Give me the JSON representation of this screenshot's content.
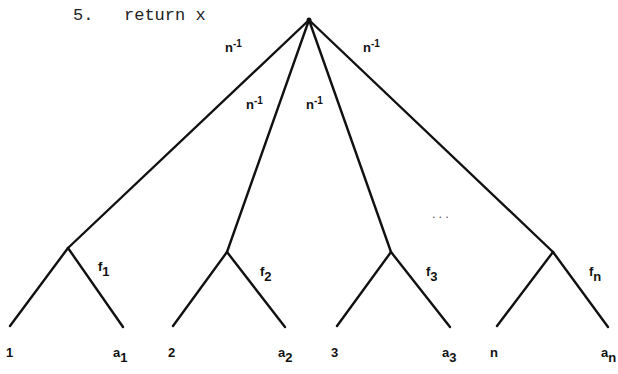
{
  "code_line": {
    "number": "5.",
    "text": "return x"
  },
  "tree": {
    "root": {
      "x": 309,
      "y": 20
    },
    "edge_color": "#111111",
    "top_edge_labels": [
      {
        "text": "n",
        "exp": "-1"
      },
      {
        "text": "n",
        "exp": "-1"
      },
      {
        "text": "n",
        "exp": "-1"
      },
      {
        "text": "n",
        "exp": "-1"
      }
    ],
    "subtrees": [
      {
        "node": {
          "x": 68,
          "y": 248
        },
        "edge_label": {
          "base": "f",
          "sub": "1"
        },
        "left_leaf": "1",
        "right_leaf": {
          "base": "a",
          "sub": "1"
        }
      },
      {
        "node": {
          "x": 227,
          "y": 252
        },
        "edge_label": {
          "base": "f",
          "sub": "2"
        },
        "left_leaf": "2",
        "right_leaf": {
          "base": "a",
          "sub": "2"
        }
      },
      {
        "node": {
          "x": 391,
          "y": 252
        },
        "edge_label": {
          "base": "f",
          "sub": "3"
        },
        "left_leaf": "3",
        "right_leaf": {
          "base": "a",
          "sub": "3"
        }
      },
      {
        "node": {
          "x": 553,
          "y": 252
        },
        "edge_label": {
          "base": "f",
          "sub": "n"
        },
        "left_leaf": "n",
        "right_leaf": {
          "base": "a",
          "sub": "n"
        }
      }
    ],
    "ellipsis": "..."
  }
}
